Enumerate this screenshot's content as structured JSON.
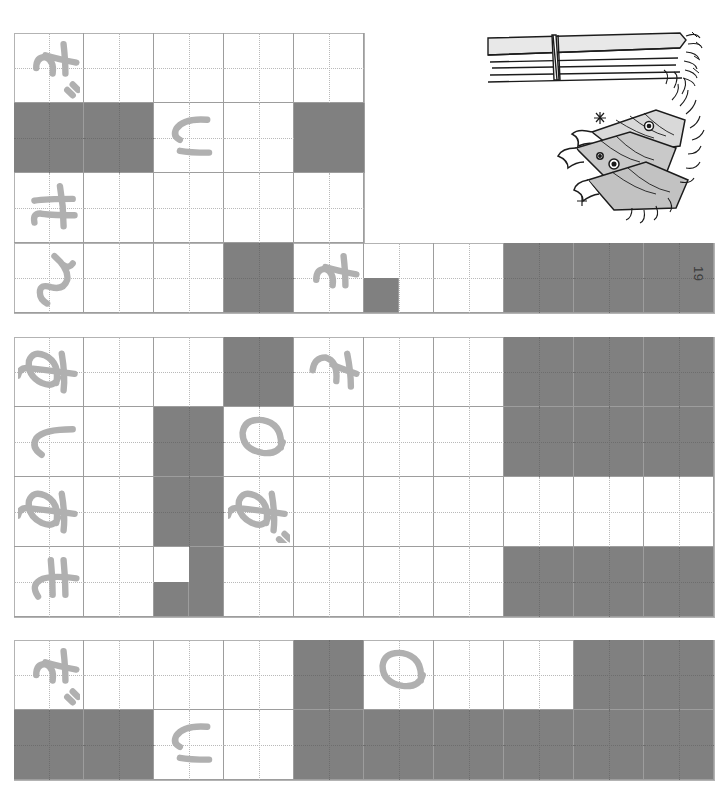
{
  "page": {
    "number": "19",
    "orientation": "rotated-90",
    "background": "#ffffff",
    "fill_color": "#808080",
    "line_color": "#9d9d9d",
    "ink_color": "#b0b0b0"
  },
  "illustration": {
    "name": "grilled-saury-fish-illustration",
    "caption": "",
    "elements": [
      "wrapped-bundle",
      "three-fish"
    ]
  },
  "blocks": [
    {
      "id": "block-1",
      "rows": [
        {
          "id": "b1-r1",
          "kana": "だ",
          "cells": [
            {
              "fill": false
            },
            {
              "fill": false
            },
            {
              "fill": false
            },
            {
              "fill": false
            },
            {
              "fill": false
            }
          ]
        },
        {
          "id": "b1-r2",
          "kana": "い",
          "cells": [
            {
              "fill": true
            },
            {
              "fill": true
            },
            {
              "fill": false
            },
            {
              "fill": false
            },
            {
              "fill": true
            }
          ]
        },
        {
          "id": "b1-r3",
          "kana": "せ",
          "cells": [
            {
              "fill": false
            },
            {
              "fill": false
            },
            {
              "fill": false
            },
            {
              "fill": false
            },
            {
              "fill": false
            }
          ]
        },
        {
          "id": "b1-r4",
          "kana": "ん",
          "cells": [
            {
              "fill": false
            },
            {
              "fill": false
            },
            {
              "fill": false
            },
            {
              "fill": true
            },
            {
              "fill": false
            },
            {
              "fill": false
            },
            {
              "fill": false
            },
            {
              "fill": true
            },
            {
              "fill": true
            },
            {
              "fill": true
            }
          ]
        }
      ]
    },
    {
      "id": "block-2",
      "rows": [
        {
          "id": "b2-r1",
          "kana": "あ",
          "cells": [
            {
              "fill": false
            },
            {
              "fill": false
            },
            {
              "fill": false
            },
            {
              "fill": true
            },
            {
              "fill": false
            },
            {
              "fill": false
            },
            {
              "fill": false
            },
            {
              "fill": true
            },
            {
              "fill": true
            },
            {
              "fill": true
            }
          ]
        },
        {
          "id": "b2-r2",
          "kana": "し",
          "cells": [
            {
              "fill": false
            },
            {
              "fill": false
            },
            {
              "fill": true
            },
            {
              "fill": false
            },
            {
              "fill": false
            },
            {
              "fill": false
            },
            {
              "fill": false
            },
            {
              "fill": true
            },
            {
              "fill": true
            },
            {
              "fill": true
            }
          ]
        },
        {
          "id": "b2-r3",
          "kana": "あ",
          "cells": [
            {
              "fill": false
            },
            {
              "fill": false
            },
            {
              "fill": true
            },
            {
              "fill": false
            },
            {
              "fill": false
            },
            {
              "fill": false
            },
            {
              "fill": false
            },
            {
              "fill": false
            },
            {
              "fill": false
            },
            {
              "fill": false
            }
          ]
        },
        {
          "id": "b2-r4",
          "kana": "も",
          "cells": [
            {
              "fill": false
            },
            {
              "fill": false
            },
            {
              "fill": false
            },
            {
              "fill": false
            },
            {
              "fill": false
            },
            {
              "fill": false
            },
            {
              "fill": false
            },
            {
              "fill": true
            },
            {
              "fill": true
            },
            {
              "fill": true
            }
          ]
        }
      ]
    },
    {
      "id": "block-3",
      "rows": [
        {
          "id": "b3-r1",
          "kana": "だ",
          "cells": [
            {
              "fill": false
            },
            {
              "fill": false
            },
            {
              "fill": false
            },
            {
              "fill": false
            },
            {
              "fill": true
            },
            {
              "fill": false
            },
            {
              "fill": false
            },
            {
              "fill": false
            },
            {
              "fill": true
            },
            {
              "fill": true
            }
          ]
        },
        {
          "id": "b3-r2",
          "kana": "い",
          "cells": [
            {
              "fill": true
            },
            {
              "fill": true
            },
            {
              "fill": false
            },
            {
              "fill": false
            },
            {
              "fill": true
            },
            {
              "fill": true
            },
            {
              "fill": true
            },
            {
              "fill": true
            },
            {
              "fill": true
            },
            {
              "fill": true
            }
          ]
        }
      ]
    }
  ],
  "handwriting": [
    {
      "id": "hw-1",
      "char": "だ",
      "block": "block-1",
      "row": 1,
      "cell": 1
    },
    {
      "id": "hw-2",
      "char": "い",
      "block": "block-1",
      "row": 2,
      "cell": 3
    },
    {
      "id": "hw-3",
      "char": "せ",
      "block": "block-1",
      "row": 3,
      "cell": 1
    },
    {
      "id": "hw-4",
      "char": "ん",
      "block": "block-1",
      "row": 4,
      "cell": 1
    },
    {
      "id": "hw-5",
      "char": "た",
      "block": "block-1",
      "row": 4,
      "cell": 5
    },
    {
      "id": "hw-6",
      "char": "あ",
      "block": "block-2",
      "row": 1,
      "cell": 1
    },
    {
      "id": "hw-7",
      "char": "さ",
      "block": "block-2",
      "row": 1,
      "cell": 5
    },
    {
      "id": "hw-8",
      "char": "し",
      "block": "block-2",
      "row": 2,
      "cell": 1
    },
    {
      "id": "hw-9",
      "char": "の",
      "block": "block-2",
      "row": 2,
      "cell": 4
    },
    {
      "id": "hw-10",
      "char": "あ",
      "block": "block-2",
      "row": 3,
      "cell": 1
    },
    {
      "id": "hw-11",
      "char": "ざ",
      "block": "block-2",
      "row": 3,
      "cell": 4
    },
    {
      "id": "hw-12",
      "char": "も",
      "block": "block-2",
      "row": 4,
      "cell": 1
    },
    {
      "id": "hw-13",
      "char": "だ",
      "block": "block-3",
      "row": 1,
      "cell": 1
    },
    {
      "id": "hw-14",
      "char": "の",
      "block": "block-3",
      "row": 1,
      "cell": 6
    },
    {
      "id": "hw-15",
      "char": "い",
      "block": "block-3",
      "row": 2,
      "cell": 3
    }
  ]
}
